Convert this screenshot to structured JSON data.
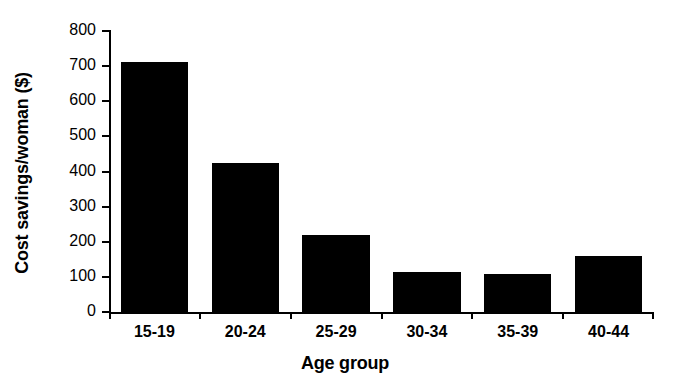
{
  "chart_data": {
    "type": "bar",
    "title": "",
    "xlabel": "Age group",
    "ylabel": "Cost savings/woman ($)",
    "categories": [
      "15-19",
      "20-24",
      "25-29",
      "30-34",
      "35-39",
      "40-44"
    ],
    "values": [
      713,
      423,
      218,
      115,
      107,
      160
    ],
    "ylim": [
      0,
      800
    ],
    "yticks": [
      0,
      100,
      200,
      300,
      400,
      500,
      600,
      700,
      800
    ],
    "ytick_labels": [
      "0",
      "100",
      "200",
      "300",
      "400",
      "500",
      "600",
      "700",
      "800"
    ],
    "grid": false,
    "legend": false,
    "bar_color": "#000000",
    "background_color": "#ffffff"
  }
}
